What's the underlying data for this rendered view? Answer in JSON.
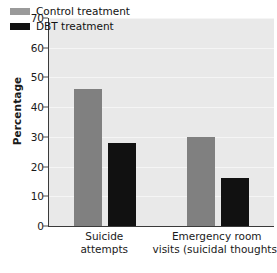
{
  "chart_data": {
    "type": "bar",
    "title": "",
    "xlabel": "",
    "ylabel": "Percentage",
    "ylim": [
      0,
      70
    ],
    "yticks": [
      0,
      10,
      20,
      30,
      40,
      50,
      60,
      70
    ],
    "grid": true,
    "legend_position": "top-left",
    "categories": [
      "Suicide attempts",
      "Emergency room visits (suicidal thoughts)"
    ],
    "category_lines": [
      [
        "Suicide",
        "attempts"
      ],
      [
        "Emergency room",
        "visits (suicidal thoughts)"
      ]
    ],
    "series": [
      {
        "name": "Control treatment",
        "color": "#808080",
        "values": [
          46,
          30
        ]
      },
      {
        "name": "DBT treatment",
        "color": "#111111",
        "values": [
          28,
          16
        ]
      }
    ]
  },
  "axis": {
    "y_title": "Percentage",
    "tick_labels": [
      "70",
      "60",
      "50",
      "40",
      "30",
      "20",
      "10",
      "0"
    ]
  },
  "legend": {
    "items": [
      {
        "label": "Control treatment",
        "swatch": "control"
      },
      {
        "label": "DBT treatment",
        "swatch": "dbt"
      }
    ]
  },
  "caption": {
    "text": ""
  }
}
